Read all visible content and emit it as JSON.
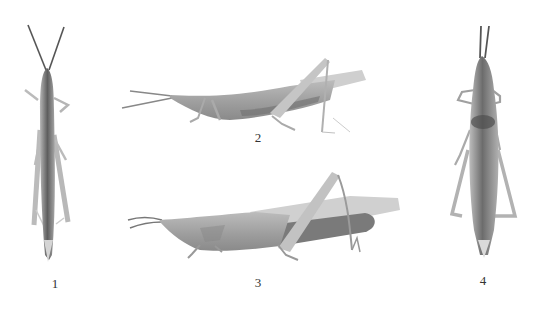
{
  "figure": {
    "background": "#ffffff",
    "specimens": [
      {
        "id": 1,
        "label": "1",
        "view": "dorsal",
        "label_pos": {
          "x": 45,
          "y": 277
        }
      },
      {
        "id": 2,
        "label": "2",
        "view": "lateral",
        "label_pos": {
          "x": 248,
          "y": 131
        }
      },
      {
        "id": 3,
        "label": "3",
        "view": "lateral",
        "label_pos": {
          "x": 248,
          "y": 276
        }
      },
      {
        "id": 4,
        "label": "4",
        "view": "dorsal",
        "label_pos": {
          "x": 473,
          "y": 274
        }
      }
    ],
    "colors": {
      "body_dark": "#6a6a6a",
      "body_mid": "#9a9a9a",
      "body_light": "#c4c4c4",
      "label_text": "#333333"
    }
  }
}
